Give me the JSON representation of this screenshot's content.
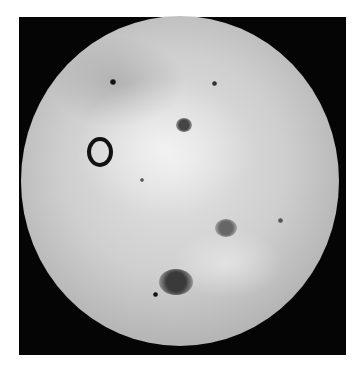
{
  "image": {
    "subject": "Io (moon of Jupiter)",
    "colors": {
      "background": "#ffffff",
      "space": "#050505",
      "surface_light": "#e4e4e4",
      "surface_mid": "#b3b3b3",
      "feature_dark": "#222222"
    }
  },
  "features": [
    {
      "name": "horseshoe-volcano",
      "x": 96,
      "y": 148,
      "w": 18,
      "h": 22,
      "type": "ring"
    },
    {
      "name": "upper-dark-patch",
      "x": 184,
      "y": 125,
      "w": 16,
      "h": 14,
      "color": "#444"
    },
    {
      "name": "lower-dark-spot",
      "x": 176,
      "y": 282,
      "w": 34,
      "h": 26,
      "color": "#3a3a3a"
    },
    {
      "name": "mid-right-spot",
      "x": 226,
      "y": 228,
      "w": 22,
      "h": 18,
      "color": "#666"
    },
    {
      "name": "small-dot-1",
      "x": 113,
      "y": 82,
      "w": 6,
      "h": 6,
      "color": "#111"
    },
    {
      "name": "small-dot-2",
      "x": 214,
      "y": 83,
      "w": 5,
      "h": 5,
      "color": "#333"
    },
    {
      "name": "small-dot-3",
      "x": 155,
      "y": 294,
      "w": 5,
      "h": 5,
      "color": "#111"
    },
    {
      "name": "small-dot-4",
      "x": 142,
      "y": 180,
      "w": 4,
      "h": 4,
      "color": "#555"
    },
    {
      "name": "small-dot-5",
      "x": 280,
      "y": 220,
      "w": 5,
      "h": 5,
      "color": "#555"
    }
  ]
}
